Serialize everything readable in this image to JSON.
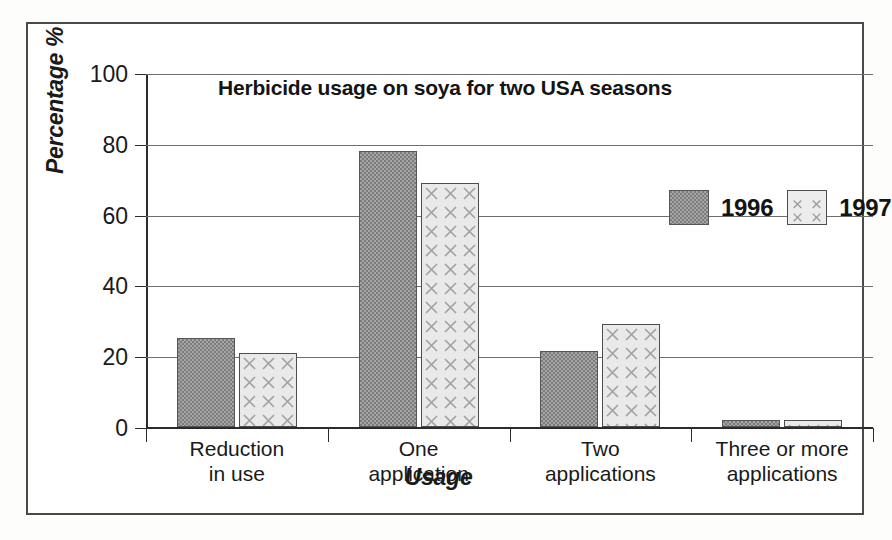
{
  "chart_data": {
    "type": "bar",
    "title": "Herbicide usage on soya for two USA seasons",
    "xlabel": "Usage",
    "ylabel": "Percentage %",
    "ylim": [
      0,
      100
    ],
    "yticks": [
      0,
      20,
      40,
      60,
      80,
      100
    ],
    "ytick_labels": [
      "0",
      "20",
      "40",
      "60",
      "80",
      "100"
    ],
    "grid": true,
    "legend_position": "top-right inside plot",
    "categories": [
      "Reduction\nin use",
      "One\napplication",
      "Two\napplications",
      "Three or more\napplications"
    ],
    "series": [
      {
        "name": "1996",
        "values": [
          25,
          78,
          21.5,
          2
        ],
        "color": "#7d7d7d",
        "pattern": "checker"
      },
      {
        "name": "1997",
        "values": [
          21,
          69,
          29,
          2
        ],
        "color": "#e9e9e9",
        "pattern": "x-hatch"
      }
    ]
  },
  "legend": {
    "items": [
      {
        "label": "1996",
        "swatch": "dark-gray-checker-swatch"
      },
      {
        "label": "1997",
        "swatch": "light-x-hatch-swatch"
      }
    ]
  },
  "colors": {
    "series_1996": "#7d7d7d",
    "series_1997": "#e9e9e9",
    "axis": "#2b2b2b",
    "grid": "#6e6e6e",
    "frame": "#4a4a4a",
    "text": "#1a1a1a",
    "background": "#ffffff"
  }
}
